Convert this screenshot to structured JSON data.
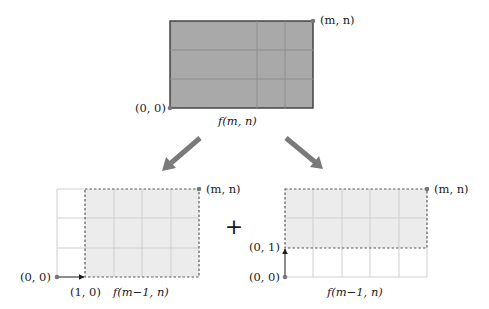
{
  "top_diagram": {
    "corner_top_right": "(m, n)",
    "corner_bottom_left": "(0, 0)",
    "caption": "f(m, n)",
    "fill_color": "#a9a9a9",
    "grid": {
      "cols": 5,
      "rows": 3
    }
  },
  "arrows": [
    {
      "direction": "down-left",
      "color": "#7a7a7a"
    },
    {
      "direction": "down-right",
      "color": "#7a7a7a"
    }
  ],
  "operator": "+",
  "bottom_left_diagram": {
    "corner_top_right": "(m, n)",
    "origin_label": "(0, 0)",
    "step_label": "(1, 0)",
    "caption": "f(m−1, n)",
    "shaded_color": "#ececec",
    "grid": {
      "cols": 5,
      "rows": 3
    },
    "shaded_region": "columns 2-5"
  },
  "bottom_right_diagram": {
    "corner_top_right": "(m, n)",
    "origin_label": "(0, 0)",
    "step_label": "(0, 1)",
    "caption": "f(m−1, n)",
    "shaded_color": "#ececec",
    "grid": {
      "cols": 5,
      "rows": 3
    },
    "shaded_region": "rows 1-2"
  }
}
